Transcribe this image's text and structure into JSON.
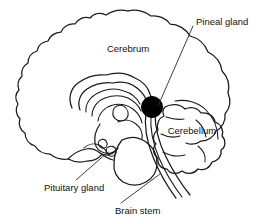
{
  "figure": {
    "type": "anatomical-line-diagram",
    "background_color": "#ffffff",
    "line_color": "#1a1a1a",
    "highlight_color": "#000000",
    "width": 277,
    "height": 224
  },
  "labels": {
    "cerebrum": {
      "text": "Cerebrum",
      "x": 128,
      "y": 49,
      "anchor": "middle",
      "has_leader_line": false
    },
    "pineal_gland": {
      "text": "Pineal gland",
      "x": 196,
      "y": 22,
      "anchor": "start",
      "has_leader_line": true,
      "leader": "M 193 26 L 158 106"
    },
    "cerebellum": {
      "text": "Cerebellum",
      "x": 192,
      "y": 131,
      "anchor": "middle",
      "has_leader_line": false
    },
    "pituitary_gland": {
      "text": "Pituitary gland",
      "x": 44,
      "y": 188,
      "anchor": "start",
      "has_leader_line": true,
      "leader": "M 76 180 L 108 152"
    },
    "brain_stem": {
      "text": "Brain stem",
      "x": 115,
      "y": 211,
      "anchor": "start",
      "has_leader_line": true,
      "leader": "M 121 203 L 160 174"
    }
  },
  "structures": {
    "cerebral_cortex": "outer convoluted cerebral hemisphere outline",
    "corpus_callosum": "arched band above the thalamus",
    "thalamus": "oval mass in the centre",
    "pineal_gland": "solid black sphere posterior to the thalamus",
    "cerebellum": "lobed structure posterior-inferior",
    "brain_stem": "midbrain, pons and medulla descending to the spinal cord",
    "pituitary_gland": "small rounded body inferior to the hypothalamus"
  },
  "pineal_marker": {
    "cx": 152,
    "cy": 107,
    "r": 10.5,
    "color": "#000000"
  }
}
